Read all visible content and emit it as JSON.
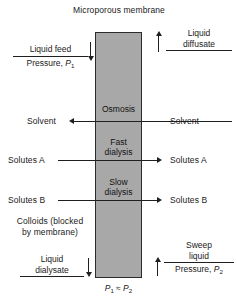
{
  "diagram": {
    "title": "Microporous membrane",
    "membrane": {
      "fill_color": "#a8a8a8",
      "stroke_color": "#2b2b2b",
      "zone_labels": [
        "Osmosis",
        "Fast dialysis",
        "Slow dialysis"
      ]
    },
    "zones": {
      "osmosis": "Osmosis",
      "fast_dialysis_line1": "Fast",
      "fast_dialysis_line2": "dialysis",
      "slow_dialysis_line1": "Slow",
      "slow_dialysis_line2": "dialysis"
    },
    "feed_side": {
      "inlet_numerator": "Liquid feed",
      "inlet_denominator_pre": "Pressure, ",
      "inlet_denominator_sym": "P",
      "inlet_denominator_sub": "1",
      "outlet_line1": "Liquid",
      "outlet_line2": "dialysate",
      "colloids_line1": "Colloids (blocked",
      "colloids_line2": "by membrane)"
    },
    "sweep_side": {
      "outlet_line1": "Liquid",
      "outlet_line2": "diffusate",
      "inlet_numerator_line1": "Sweep",
      "inlet_numerator_line2": "liquid",
      "inlet_denominator_pre": "Pressure, ",
      "inlet_denominator_sym": "P",
      "inlet_denominator_sub": "2"
    },
    "flows": [
      {
        "label_left": "Solvent",
        "label_right": "Solvent",
        "direction": "right-to-left"
      },
      {
        "label_left": "Solutes A",
        "label_right": "Solutes A",
        "direction": "left-to-right"
      },
      {
        "label_left": "Solutes B",
        "label_right": "Solutes B",
        "direction": "left-to-right"
      }
    ],
    "flow_solvent_left": "Solvent",
    "flow_solvent_right": "Solvent",
    "flow_solutes_a_left": "Solutes A",
    "flow_solutes_a_right": "Solutes A",
    "flow_solutes_b_left": "Solutes B",
    "flow_solutes_b_right": "Solutes B",
    "pressure_relation": {
      "left_sym": "P",
      "left_sub": "1",
      "operator": "≈",
      "right_sym": "P",
      "right_sub": "2"
    }
  }
}
